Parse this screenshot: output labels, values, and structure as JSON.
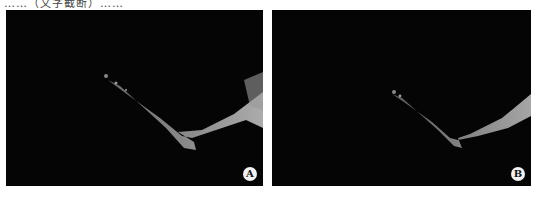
{
  "figure": {
    "top_text_fragment": "……（文字截断）……",
    "panels": [
      {
        "id": "A",
        "label": "A",
        "description": "Dark 3D angiographic/bone rendering with V-shaped bright structure"
      },
      {
        "id": "B",
        "label": "B",
        "description": "Dark 3D angiographic/bone rendering with V-shaped bright structure, sparser"
      }
    ],
    "colors": {
      "background": "#050505",
      "structure": "#b8b8b8",
      "label_bg": "#f2f2f2"
    }
  }
}
